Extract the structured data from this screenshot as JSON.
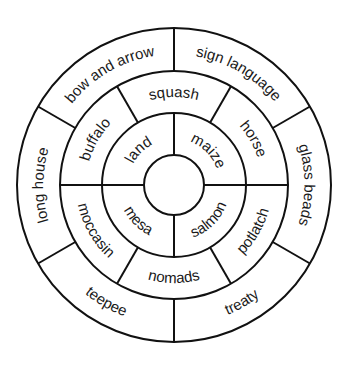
{
  "diagram": {
    "type": "concentric-wheel",
    "colors": {
      "stroke": "#111111",
      "text": "#1a1a1a",
      "background": "#ffffff"
    },
    "geometry": {
      "cx": 174,
      "cy": 185,
      "radii": [
        30,
        72,
        114,
        157
      ]
    },
    "rings": [
      {
        "name": "inner",
        "boundaries_deg": [
          0,
          90,
          180,
          270
        ],
        "labels": [
          {
            "text": "maize",
            "angle": 45
          },
          {
            "text": "land",
            "angle": 135
          },
          {
            "text": "mesa",
            "angle": 225
          },
          {
            "text": "salmon",
            "angle": 315
          }
        ]
      },
      {
        "name": "middle",
        "boundaries_deg": [
          0,
          60,
          120,
          180,
          240,
          300
        ],
        "labels": [
          {
            "text": "horse",
            "angle": 30
          },
          {
            "text": "squash",
            "angle": 90
          },
          {
            "text": "buffalo",
            "angle": 150
          },
          {
            "text": "moccasin",
            "angle": 210
          },
          {
            "text": "nomads",
            "angle": 270
          },
          {
            "text": "potlatch",
            "angle": 330
          }
        ]
      },
      {
        "name": "outer",
        "boundaries_deg": [
          30,
          90,
          150,
          210,
          270,
          330
        ],
        "labels": [
          {
            "text": "sign language",
            "angle": 60
          },
          {
            "text": "bow and arrow",
            "angle": 120
          },
          {
            "text": "long house",
            "angle": 180
          },
          {
            "text": "teepee",
            "angle": 240
          },
          {
            "text": "treaty",
            "angle": 300
          },
          {
            "text": "glass beads",
            "angle": 0
          }
        ]
      }
    ]
  }
}
